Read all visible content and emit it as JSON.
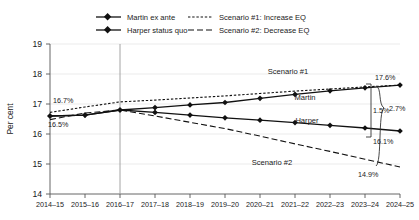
{
  "chart_data": {
    "type": "line",
    "title": "",
    "xlabel": "",
    "ylabel": "Per cent",
    "ylim": [
      14,
      19
    ],
    "yticks": [
      14,
      15,
      16,
      17,
      18,
      19
    ],
    "grid": true,
    "legend_position": "top-center",
    "categories": [
      "2014–15",
      "2015–16",
      "2016–17",
      "2017–18",
      "2018–19",
      "2019–20",
      "2020–21",
      "2021–22",
      "2022–23",
      "2023–24",
      "2024–25"
    ],
    "series": [
      {
        "name": "Martin ex ante",
        "style": "solid",
        "marker": "diamond",
        "color": "#111111",
        "values": [
          16.6,
          16.63,
          16.8,
          16.88,
          16.97,
          17.05,
          17.19,
          17.32,
          17.44,
          17.54,
          17.63
        ]
      },
      {
        "name": "Harper status quo",
        "style": "solid",
        "marker": "diamond",
        "color": "#111111",
        "values": [
          16.6,
          16.63,
          16.8,
          16.72,
          16.63,
          16.54,
          16.46,
          16.38,
          16.29,
          16.2,
          16.1
        ]
      },
      {
        "name": "Scenario #1: Increase EQ",
        "style": "dotted",
        "marker": "none",
        "color": "#111111",
        "values": [
          16.72,
          16.9,
          17.07,
          17.13,
          17.2,
          17.27,
          17.35,
          17.43,
          17.5,
          17.57,
          17.63
        ]
      },
      {
        "name": "Scenario #2: Decrease EQ",
        "style": "dashed",
        "marker": "none",
        "color": "#111111",
        "values": [
          16.48,
          16.7,
          16.8,
          16.6,
          16.39,
          16.18,
          15.93,
          15.67,
          15.42,
          15.16,
          14.9
        ]
      }
    ],
    "legend_entries": [
      "Martin ex ante",
      "Harper status quo",
      "Scenario #1: Increase EQ",
      "Scenario #2: Decrease EQ"
    ],
    "inline_labels": [
      {
        "text": "Scenario #1"
      },
      {
        "text": "Martin"
      },
      {
        "text": "Harper"
      },
      {
        "text": "Scenario #2"
      }
    ],
    "annotations": [
      {
        "text": "16.7%"
      },
      {
        "text": "16.5%"
      },
      {
        "text": "17.6%"
      },
      {
        "text": "1.5%"
      },
      {
        "text": "2.7%"
      },
      {
        "text": "16.1%"
      },
      {
        "text": "14.9%"
      }
    ],
    "reference_line": {
      "at_category": "2016–17"
    }
  },
  "axis": {
    "y_label": "Per cent",
    "y_ticks": [
      "19",
      "18",
      "17",
      "16",
      "15",
      "14"
    ],
    "x_ticks": [
      "2014–15",
      "2015–16",
      "2016–17",
      "2017–18",
      "2018–19",
      "2019–20",
      "2020–21",
      "2021–22",
      "2022–23",
      "2023–24",
      "2024–25"
    ]
  },
  "legend": {
    "item_1": "Martin ex ante",
    "item_2": "Harper status quo",
    "item_3": "Scenario #1: Increase EQ",
    "item_4": "Scenario #2: Decrease EQ"
  },
  "inline": {
    "scenario1": "Scenario #1",
    "scenario2": "Scenario #2",
    "martin": "Martin",
    "harper": "Harper"
  },
  "annotations": {
    "left_top": "16.7%",
    "left_bottom": "16.5%",
    "right_top": "17.6%",
    "gap_inner": "1.5%",
    "gap_outer": "2.7%",
    "right_mid": "16.1%",
    "right_bottom": "14.9%"
  }
}
